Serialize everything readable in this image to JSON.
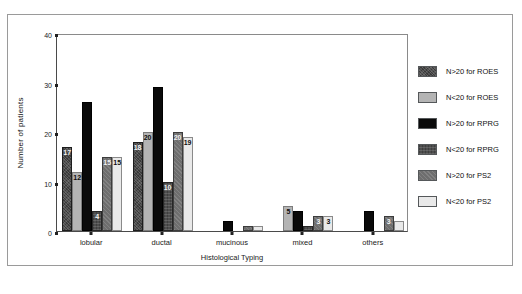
{
  "chart_data": {
    "type": "bar",
    "title": "",
    "xlabel": "Histological Typing",
    "ylabel": "Number of patients",
    "categories": [
      "lobular",
      "ductal",
      "mucinous",
      "mixed",
      "others"
    ],
    "ylim": [
      0,
      40
    ],
    "yticks": [
      0,
      10,
      20,
      30,
      40
    ],
    "grid": false,
    "legend_position": "right",
    "series": [
      {
        "name": "N>20 for ROES",
        "color": "#3a3a3a",
        "values": [
          17,
          18,
          0,
          0,
          0
        ],
        "labels": [
          "17",
          "18",
          "",
          "",
          ""
        ]
      },
      {
        "name": "N<20 for ROES",
        "color": "#b4b4b4",
        "values": [
          12,
          20,
          0,
          5,
          0
        ],
        "labels": [
          "12",
          "20",
          "",
          "5",
          ""
        ]
      },
      {
        "name": "N>20 for RPRG",
        "color": "#0a0a0a",
        "values": [
          26,
          29,
          2,
          4,
          4
        ],
        "labels": [
          "",
          "",
          "",
          "",
          ""
        ]
      },
      {
        "name": "N<20 for RPRG",
        "color": "#4e4e4e",
        "values": [
          4,
          10,
          0,
          1,
          0
        ],
        "labels": [
          "4",
          "10",
          "",
          "",
          ""
        ]
      },
      {
        "name": "N>20 for PS2",
        "color": "#6e6e6e",
        "values": [
          15,
          20,
          1,
          3,
          3
        ],
        "labels": [
          "15",
          "20",
          "",
          "3",
          "3"
        ]
      },
      {
        "name": "N<20 for PS2",
        "color": "#e9e9e9",
        "values": [
          15,
          19,
          1,
          3,
          2
        ],
        "labels": [
          "15",
          "19",
          "",
          "3",
          ""
        ]
      }
    ]
  },
  "legend": {
    "items": [
      {
        "label": "N>20 for ROES"
      },
      {
        "label": "N<20 for ROES"
      },
      {
        "label": "N>20 for RPRG"
      },
      {
        "label": "N<20 for RPRG"
      },
      {
        "label": "N>20 for PS2"
      },
      {
        "label": "N<20 for PS2"
      }
    ]
  }
}
